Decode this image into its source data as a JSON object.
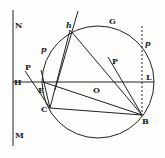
{
  "diagram": {
    "type": "geometric-construction",
    "labels": {
      "N": "N",
      "H": "H",
      "M": "M",
      "h": "h",
      "G": "G",
      "p_upper_right": "p",
      "p_left": "p",
      "P_center": "P",
      "P_left": "P",
      "E": "E",
      "O": "O",
      "L": "L",
      "C": "C",
      "B": "B"
    },
    "points": {
      "h": [
        70,
        30
      ],
      "C": [
        50,
        108
      ],
      "B": [
        142,
        115
      ],
      "E": [
        43,
        82
      ],
      "H": [
        13,
        82
      ],
      "L": [
        155,
        82
      ],
      "O": [
        98,
        82
      ]
    },
    "circle": {
      "cx": 98,
      "cy": 82,
      "r": 56
    },
    "stroke_color": "#222222"
  }
}
